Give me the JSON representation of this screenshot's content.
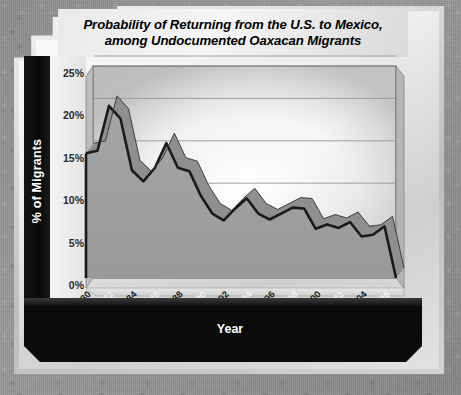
{
  "chart_data": {
    "type": "area",
    "title": "Probability of Returning from the U.S. to Mexico, among Undocumented Oaxacan Migrants",
    "title_line1": "Probability of Returning from the U.S. to Mexico,",
    "title_line2": "among Undocumented Oaxacan Migrants",
    "xlabel": "Year",
    "ylabel": "% of Migrants",
    "ylim": [
      0,
      25
    ],
    "yticks": [
      0,
      5,
      10,
      15,
      20,
      25
    ],
    "ytick_labels": [
      "0%",
      "5%",
      "10%",
      "15%",
      "20%",
      "25%"
    ],
    "grid": true,
    "legend": "none",
    "xtick_labels": [
      "1980",
      "1982",
      "1984",
      "1986",
      "1988",
      "1990",
      "1992",
      "1994",
      "1996",
      "1998",
      "2000",
      "2002",
      "2004",
      "2006"
    ],
    "x": [
      1980,
      1981,
      1982,
      1983,
      1984,
      1985,
      1986,
      1987,
      1988,
      1989,
      1990,
      1991,
      1992,
      1993,
      1994,
      1995,
      1996,
      1997,
      1998,
      1999,
      2000,
      2001,
      2002,
      2003,
      2004,
      2005,
      2006,
      2007
    ],
    "values": [
      14.7,
      15.0,
      20.3,
      18.8,
      12.7,
      11.4,
      13.0,
      15.9,
      13.0,
      12.6,
      9.7,
      7.6,
      6.8,
      8.2,
      9.4,
      7.6,
      6.9,
      7.6,
      8.3,
      8.2,
      5.8,
      6.3,
      5.9,
      6.6,
      4.9,
      5.1,
      6.1,
      0.0
    ],
    "series_color": "#1a1a1a",
    "fill_color": "#9d9d9d",
    "accent_dark": "#6f6f6f"
  },
  "axis": {
    "y_title": "% of Migrants",
    "x_title": "Year"
  }
}
